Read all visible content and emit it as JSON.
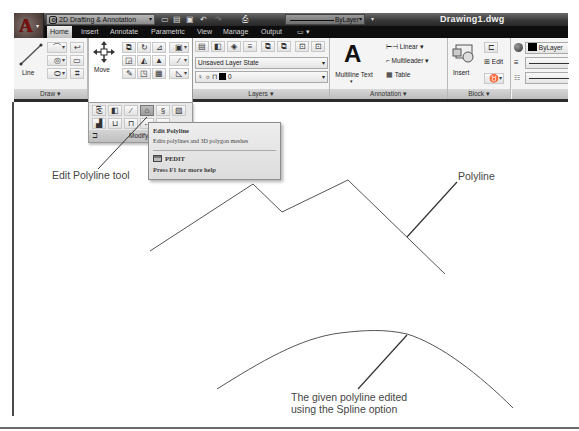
{
  "app": {
    "title": "Drawing1.dwg",
    "app_button_glyph": "A",
    "app_button_icon": "autocad-logo-icon"
  },
  "quick_access": {
    "workspace": "2D Drafting & Annotation",
    "icons": [
      "open-icon",
      "save-icon",
      "save-as-icon",
      "undo-icon",
      "redo-icon",
      "plot-icon"
    ],
    "layer_dropdown": "ByLayer"
  },
  "tabs": [
    {
      "label": "Home",
      "active": true
    },
    {
      "label": "Insert"
    },
    {
      "label": "Annotate"
    },
    {
      "label": "Parametric"
    },
    {
      "label": "View"
    },
    {
      "label": "Manage"
    },
    {
      "label": "Output"
    }
  ],
  "ribbon": {
    "draw": {
      "label": "Draw ▾",
      "line": "Line"
    },
    "modify": {
      "label": "Modify",
      "move": "Move"
    },
    "layers": {
      "label": "Layers ▾",
      "layer_state": "Unsaved Layer State",
      "current_layer": "0"
    },
    "annotation": {
      "label": "Annotation ▾",
      "multiline_text": "Multiline Text",
      "linear": "Linear ▾",
      "multileader": "Multileader ▾",
      "table": "Table"
    },
    "block": {
      "label": "Block ▾",
      "insert": "Insert",
      "edit": "Edit"
    },
    "properties": {
      "color": "ByLayer",
      "color_swatch": "#000000"
    }
  },
  "tooltip": {
    "title": "Edit Polyline",
    "description": "Edits polylines and 3D polygon meshes",
    "command": "PEDIT",
    "help": "Press F1 for more help"
  },
  "annotations": {
    "edit_polyline_tool": "Edit Polyline tool",
    "polyline": "Polyline",
    "spline_line1": "The given polyline edited",
    "spline_line2": "using the Spline option"
  },
  "drawing": {
    "line_color": "#555555",
    "polyline_points": "150,251 253,184 282,212 348,180 445,274",
    "spline_path": "M217,389 C260,362 300,338 340,333 C365,330 385,329 407,334 C440,344 480,375 513,408",
    "leader_tool_points": "98,169 147,117",
    "leader_polyline_points": "407,237 457,182",
    "leader_spline_points": "407,335 358,389"
  }
}
